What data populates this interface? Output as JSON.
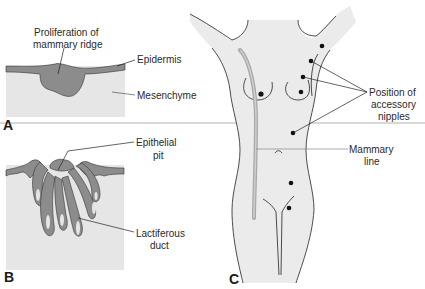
{
  "figure": {
    "panels": [
      {
        "id": "A",
        "label": "A",
        "annotations": {
          "proliferation_line1": "Proliferation of",
          "proliferation_line2": "mammary ridge",
          "epidermis": "Epidermis",
          "mesenchyme": "Mesenchyme"
        }
      },
      {
        "id": "B",
        "label": "B",
        "annotations": {
          "epithelial_line1": "Epithelial",
          "epithelial_line2": "pit",
          "lactiferous_line1": "Lactiferous",
          "lactiferous_line2": "duct"
        }
      },
      {
        "id": "C",
        "label": "C",
        "annotations": {
          "position_line1": "Position of",
          "position_line2": "accessory",
          "position_line3": "nipples",
          "mammary_line1": "Mammary",
          "mammary_line2": "line"
        },
        "accessory_nipple_count": 6
      }
    ],
    "colors": {
      "tissue_fill": "#e6e6e6",
      "epidermis_fill": "#8c8c8c",
      "body_fill": "#ebebeb",
      "mammary_line": "#9a9a9a",
      "outline": "#222222",
      "divider": "#9a9a9a"
    }
  }
}
